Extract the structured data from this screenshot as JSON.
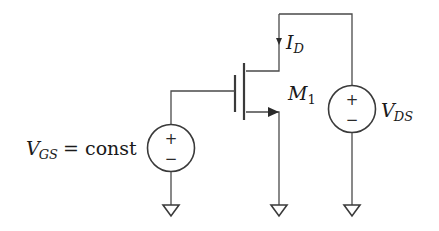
{
  "diagram": {
    "type": "circuit-schematic",
    "transistor": {
      "name_main": "M",
      "name_sub": "1",
      "type": "NMOS"
    },
    "current": {
      "main": "I",
      "sub": "D",
      "direction": "down-into-drain"
    },
    "sources": {
      "gate": {
        "main": "V",
        "sub": "GS",
        "suffix": "= const",
        "plus": "+",
        "minus": "−"
      },
      "drain": {
        "main": "V",
        "sub": "DS",
        "plus": "+",
        "minus": "−"
      }
    },
    "grounds": 3,
    "colors": {
      "line": "#4a4a4a",
      "text": "#1a1a1a",
      "background": "#ffffff"
    }
  }
}
